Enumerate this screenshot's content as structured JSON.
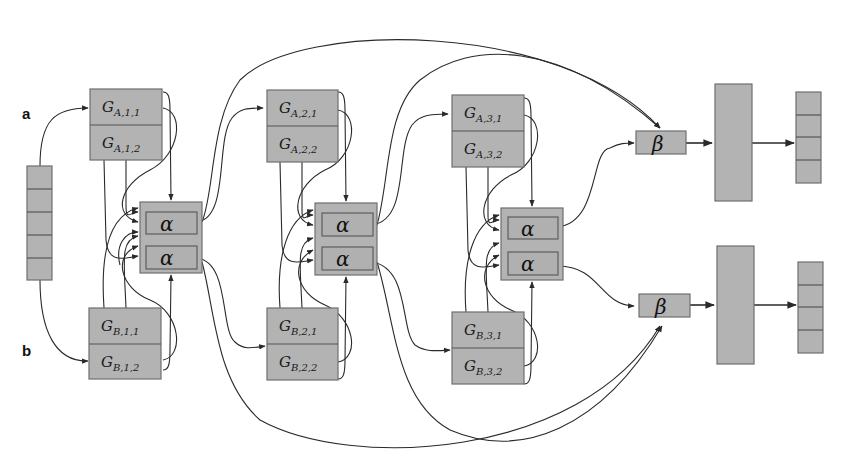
{
  "panels": {
    "a": "a",
    "b": "b"
  },
  "input_vector": {
    "cells": 5
  },
  "gates": {
    "A": [
      {
        "main": "G",
        "sub1": "A,1,1",
        "sub2": "A,1,2"
      },
      {
        "main": "G",
        "sub1": "A,2,1",
        "sub2": "A,2,2"
      },
      {
        "main": "G",
        "sub1": "A,3,1",
        "sub2": "A,3,2"
      }
    ],
    "B": [
      {
        "main": "G",
        "sub1": "B,1,1",
        "sub2": "B,1,2"
      },
      {
        "main": "G",
        "sub1": "B,2,1",
        "sub2": "B,2,2"
      },
      {
        "main": "G",
        "sub1": "B,3,1",
        "sub2": "B,3,2"
      }
    ]
  },
  "alpha_blocks": [
    {
      "top": "α",
      "bottom": "α"
    },
    {
      "top": "α",
      "bottom": "α"
    },
    {
      "top": "α",
      "bottom": "α"
    }
  ],
  "beta_blocks": [
    {
      "label": "β"
    },
    {
      "label": "β"
    }
  ],
  "outputs": [
    {
      "cells": 4
    },
    {
      "cells": 4
    }
  ],
  "colors": {
    "box_fill": "#b3b3b3",
    "box_stroke": "#6e6e6e",
    "line": "#2a2a2a"
  }
}
